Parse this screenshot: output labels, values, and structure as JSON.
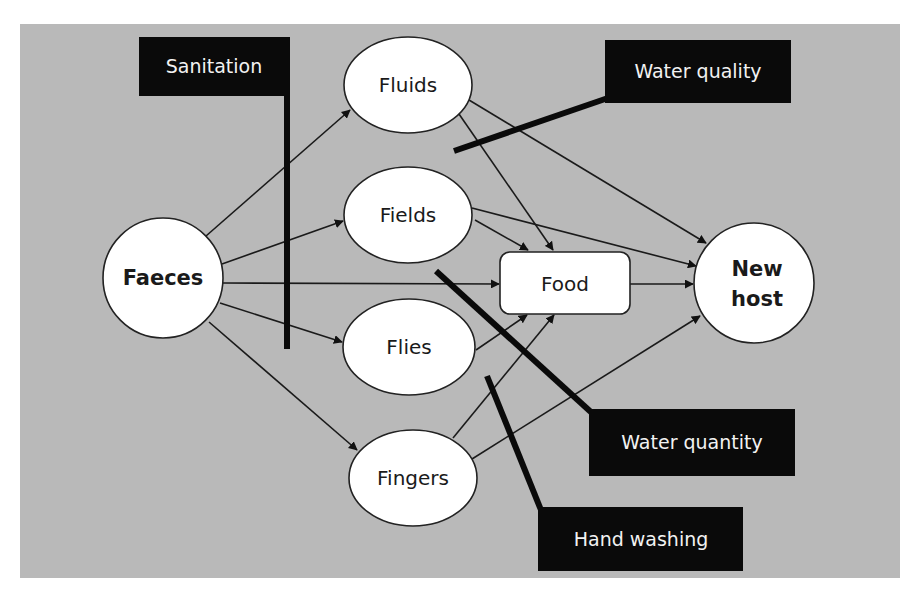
{
  "diagram": {
    "background_color": "#b9b9b9",
    "nodes": {
      "faeces": "Faeces",
      "fluids": "Fluids",
      "fields": "Fields",
      "flies": "Flies",
      "fingers": "Fingers",
      "food": "Food",
      "new_host_line1": "New",
      "new_host_line2": "host"
    },
    "barriers": {
      "sanitation": "Sanitation",
      "water_quality": "Water quality",
      "water_quantity": "Water quantity",
      "hand_washing": "Hand washing"
    },
    "edges": [
      {
        "from": "Faeces",
        "to": "Fluids"
      },
      {
        "from": "Faeces",
        "to": "Fields"
      },
      {
        "from": "Faeces",
        "to": "Food"
      },
      {
        "from": "Faeces",
        "to": "Flies"
      },
      {
        "from": "Faeces",
        "to": "Fingers"
      },
      {
        "from": "Fluids",
        "to": "Food"
      },
      {
        "from": "Fluids",
        "to": "New host"
      },
      {
        "from": "Fields",
        "to": "Food"
      },
      {
        "from": "Fields",
        "to": "New host"
      },
      {
        "from": "Flies",
        "to": "Food"
      },
      {
        "from": "Fingers",
        "to": "Food"
      },
      {
        "from": "Fingers",
        "to": "New host"
      },
      {
        "from": "Food",
        "to": "New host"
      }
    ]
  },
  "caption": {
    "text": ""
  }
}
